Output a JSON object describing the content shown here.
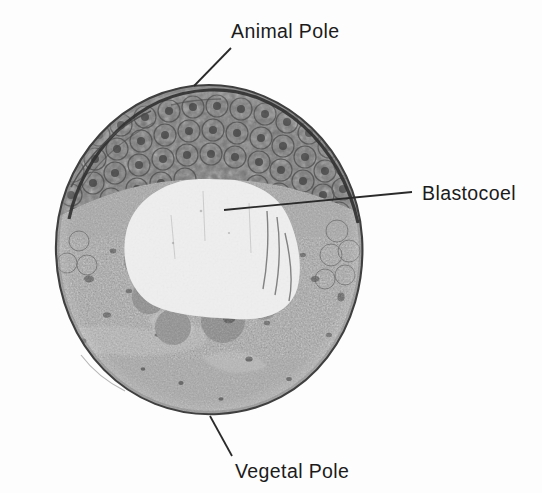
{
  "figure": {
    "width": 542,
    "height": 493,
    "background_color": "#fdfdfd",
    "image_type": "grayscale histological light micrograph"
  },
  "labels": {
    "animal_pole": "Animal Pole",
    "blastocoel": "Blastocoel",
    "vegetal_pole": "Vegetal Pole"
  },
  "label_positions": {
    "animal_pole": {
      "x": 231,
      "y": 22
    },
    "blastocoel": {
      "x": 422,
      "y": 184
    },
    "vegetal_pole": {
      "x": 235,
      "y": 462
    }
  },
  "leader_lines": [
    {
      "name": "animal-pole-leader",
      "x1": 231,
      "y1": 48,
      "x2": 194,
      "y2": 86
    },
    {
      "name": "blastocoel-leader",
      "x1": 412,
      "y1": 192,
      "x2": 224,
      "y2": 210
    },
    {
      "name": "vegetal-pole-leader",
      "x1": 232,
      "y1": 456,
      "x2": 210,
      "y2": 416
    }
  ],
  "colors": {
    "text": "#1b1b1b",
    "leader_line": "#2a2a2a",
    "background": "#fdfdfd",
    "animal_cap_dark": "#6e6e6e",
    "animal_cap_darkest": "#4a4a4a",
    "blastocoel_cavity": "#ececec",
    "vegetal_yolk": "#9d9d9d",
    "membrane_outline": "#3c3c3c"
  },
  "specimen": {
    "name": "blastula-section",
    "bounds": {
      "left": 53,
      "top": 83,
      "width": 312,
      "height": 334
    },
    "center": {
      "x": 209,
      "y": 250
    },
    "radius_x": 154,
    "radius_y": 166,
    "regions": [
      {
        "name": "animal-cap",
        "description": "darkly pigmented roof of small densely packed micromeres forming the upper third of the section",
        "tone": "dark gray"
      },
      {
        "name": "blastocoel",
        "description": "large pale fluid-filled cavity occupying the upper-central interior",
        "tone": "near white",
        "extent": {
          "cx": 196,
          "cy": 205,
          "rx": 78,
          "ry": 52
        }
      },
      {
        "name": "blastocoel-floor-cells",
        "description": "cluster of large rounded deep cells lining the floor of the cavity",
        "tone": "medium gray"
      },
      {
        "name": "vegetal-hemisphere",
        "description": "finely granular yolk-laden macromere mass filling the lower two thirds",
        "tone": "mid gray, uniformly speckled"
      },
      {
        "name": "fertilization-envelope-fragment",
        "description": "thin detached membrane flap along the upper-left rim",
        "tone": "thin dark line"
      }
    ]
  }
}
